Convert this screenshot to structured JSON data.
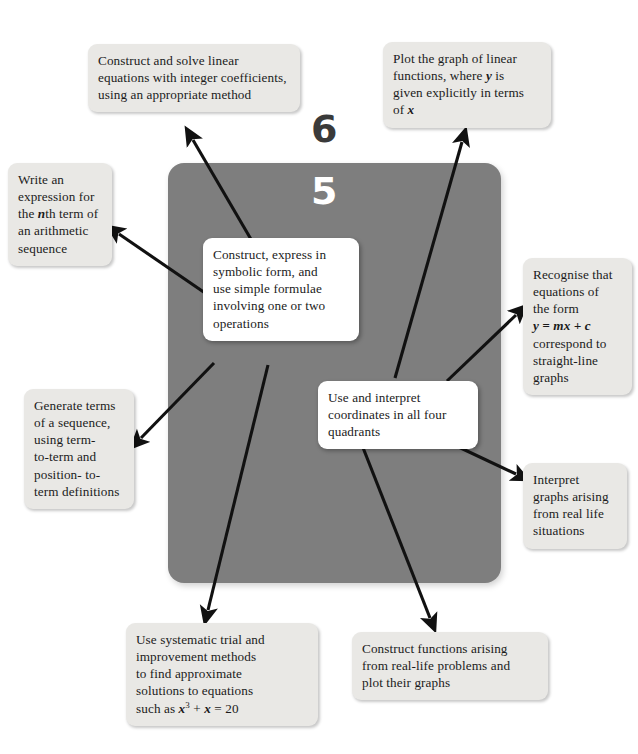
{
  "page": {
    "numbers": {
      "top": "6",
      "bottom": "5"
    },
    "panel_color": "#7e7e7e",
    "outer_box_color": "#e9e8e5",
    "inner_box_color": "#ffffff",
    "arrow_color": "#111111"
  },
  "diagram": {
    "type": "radial-concept-map",
    "center_nodes": [
      {
        "id": "symbolic",
        "lines": [
          "Construct, express in",
          "symbolic form, and",
          "use simple formulae",
          "involving one or two",
          "operations"
        ]
      },
      {
        "id": "coordinates",
        "lines": [
          "Use and interpret",
          "coordinates in all four",
          "quadrants"
        ]
      }
    ],
    "outer_nodes": [
      {
        "id": "construct-solve",
        "lines": [
          "Construct and solve linear",
          "equations with integer coefficients,",
          "using an appropriate method"
        ]
      },
      {
        "id": "plot-graph",
        "lines": [
          "Plot the graph of linear",
          "functions, where y is",
          "given explicitly in terms",
          "of x"
        ]
      },
      {
        "id": "nth-term",
        "lines": [
          "Write an",
          "expression for",
          "the nth term of",
          "an arithmetic",
          "sequence"
        ]
      },
      {
        "id": "recognise",
        "lines": [
          "Recognise that",
          "equations of",
          "the form",
          "y = mx + c",
          "correspond to",
          "straight-line",
          "graphs"
        ]
      },
      {
        "id": "generate",
        "lines": [
          "Generate terms",
          "of a sequence,",
          "using term-",
          "to-term and",
          "position- to-",
          "term definitions"
        ]
      },
      {
        "id": "interpret",
        "lines": [
          "Interpret",
          "graphs arising",
          "from real life",
          "situations"
        ]
      },
      {
        "id": "trial",
        "lines": [
          "Use systematic trial and",
          "improvement methods",
          "to find approximate",
          "solutions to equations",
          "such as x3 + x = 20"
        ]
      },
      {
        "id": "construct-fn",
        "lines": [
          "Construct functions arising",
          "from real-life problems and",
          "plot their graphs"
        ]
      }
    ],
    "connections": [
      {
        "from": "symbolic",
        "to": "construct-solve"
      },
      {
        "from": "symbolic",
        "to": "nth-term"
      },
      {
        "from": "symbolic",
        "to": "generate"
      },
      {
        "from": "symbolic",
        "to": "trial"
      },
      {
        "from": "coordinates",
        "to": "plot-graph"
      },
      {
        "from": "coordinates",
        "to": "recognise"
      },
      {
        "from": "coordinates",
        "to": "interpret"
      },
      {
        "from": "coordinates",
        "to": "construct-fn"
      }
    ]
  }
}
